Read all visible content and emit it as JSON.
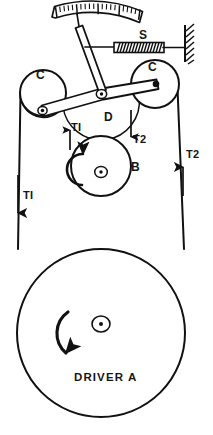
{
  "figure": {
    "stroke_color": "#111111",
    "background_color": "#ffffff",
    "width": 213,
    "height": 435
  },
  "labels": {
    "spring": "S",
    "idler_left": "C",
    "idler_right": "C",
    "pivot": "D",
    "pulley_b": "B",
    "tension_slack_upper": "TI",
    "tension_tight_upper": "T2",
    "tension_slack_lower": "TI",
    "tension_tight_lower": "T2",
    "driver": "DRIVER  A"
  },
  "components": {
    "scale_arc": {
      "name": "graduated-scale",
      "major_ticks": 5,
      "minor_ticks_per_major": 4
    },
    "pointer": {
      "name": "pointer-needle"
    },
    "spring": {
      "name": "coil-spring",
      "coils": 17
    },
    "wall": {
      "name": "fixed-wall-hatching",
      "hatch_lines": 7
    },
    "bell_crank": {
      "name": "bell-crank-lever"
    },
    "idler_pulley_left": {
      "name": "idler-pulley-c-left",
      "radius": 23
    },
    "idler_pulley_right": {
      "name": "idler-pulley-c-right",
      "radius": 24
    },
    "pivot_d": {
      "name": "pivot-point-d"
    },
    "pulley_b": {
      "name": "pulley-b",
      "radius": 30,
      "rotation": "counter-clockwise"
    },
    "driver_pulley_a": {
      "name": "driver-pulley-a",
      "radius": 84,
      "rotation": "counter-clockwise"
    },
    "belt_left": {
      "name": "belt-slack-side",
      "arrow_direction": "down"
    },
    "belt_right": {
      "name": "belt-tight-side",
      "arrow_direction": "up"
    }
  }
}
